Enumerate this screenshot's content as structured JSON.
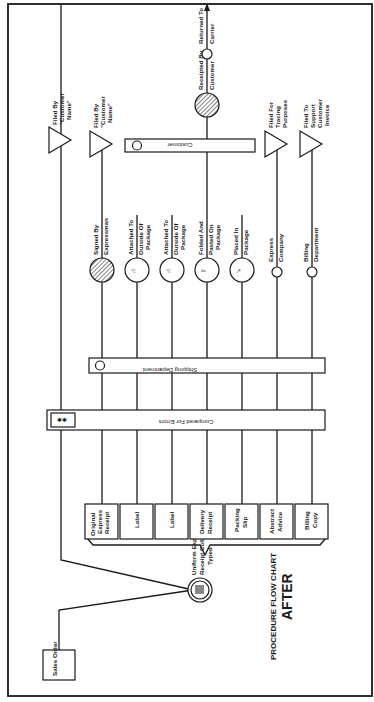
{
  "title": {
    "line1": "PROCEDURE FLOW CHART",
    "line2": "AFTER"
  },
  "start": {
    "sales_order": "Sales Order",
    "typing_step": [
      "Uniform Express",
      "Receipt Collect",
      "Typed"
    ]
  },
  "copies": [
    {
      "label": [
        "Original",
        "Express",
        "Receipt"
      ]
    },
    {
      "label": [
        "Label"
      ]
    },
    {
      "label": [
        "Label"
      ]
    },
    {
      "label": [
        "Delivery",
        "Receipt"
      ]
    },
    {
      "label": [
        "Packing",
        "Slip"
      ]
    },
    {
      "label": [
        "Abstract",
        "Advice"
      ]
    },
    {
      "label": [
        "Billing",
        "Copy"
      ]
    }
  ],
  "bars": {
    "compared": "Compared For Errors",
    "shipping": "Shipping Department",
    "customer": "Customer"
  },
  "steps": [
    {
      "label": [
        "Signed By",
        "Expressman"
      ],
      "symbol": "hatched-circle"
    },
    {
      "label": [
        "Attached To",
        "Outside Of",
        "Package"
      ],
      "symbol": "hand-circle"
    },
    {
      "label": [
        "Attached To",
        "Outside Of",
        "Package"
      ],
      "symbol": "hand-circle"
    },
    {
      "label": [
        "Folded And",
        "Pasted On",
        "Package"
      ],
      "symbol": "fold-circle"
    },
    {
      "label": [
        "Placed In",
        "Package"
      ],
      "symbol": "place-circle"
    },
    {
      "label": [
        "Express",
        "Company"
      ],
      "symbol": "to-circle"
    },
    {
      "label": [
        "Billing",
        "Department"
      ],
      "symbol": "to-circle"
    }
  ],
  "files": [
    {
      "label": [
        "Filed By",
        "\"Customer",
        "Name\""
      ]
    },
    {
      "label": [
        "Filed By",
        "\"Customer",
        "Name\""
      ]
    },
    {
      "label": [
        "Filed For",
        "Tracing",
        "Purposes"
      ]
    },
    {
      "label": [
        "Filed To",
        "Support",
        "Customer",
        "Invoice"
      ]
    }
  ],
  "end": {
    "receipted": [
      "Receipted  By",
      "Customer"
    ],
    "returned": [
      "Returned  To",
      "Carrier"
    ],
    "to_symbol": "To"
  },
  "colors": {
    "ink": "#1a1a1a",
    "paper": "#ffffff"
  }
}
